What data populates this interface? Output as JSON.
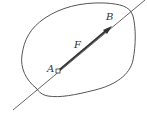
{
  "diagram": {
    "labels": {
      "A": "A",
      "B": "B",
      "F": "F"
    },
    "colors": {
      "stroke": "#555555",
      "background": "#ffffff"
    }
  }
}
